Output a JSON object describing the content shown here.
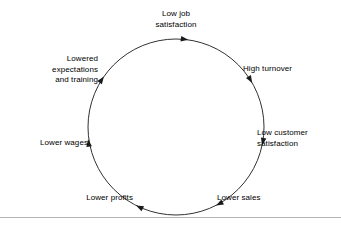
{
  "diagram": {
    "type": "cycle",
    "title": "",
    "direction": "clockwise",
    "background_color": "#ffffff",
    "stroke_color": "#1a1a1a",
    "text_color": "#000000",
    "rule_color": "#b4b4b4",
    "circle": {
      "cx": 176,
      "cy": 127,
      "r": 88
    },
    "nodes": [
      {
        "id": "low-job-satisfaction",
        "label": "Low job\nsatisfaction",
        "position": "top",
        "angle_deg": -90,
        "align": "center"
      },
      {
        "id": "high-turnover",
        "label": "High turnover",
        "position": "upper-right",
        "angle_deg": -30,
        "align": "left"
      },
      {
        "id": "low-customer-satisfaction",
        "label": "Low customer\nsatisfaction",
        "position": "right",
        "angle_deg": 15,
        "align": "left"
      },
      {
        "id": "lower-sales",
        "label": "Lower sales",
        "position": "lower-right",
        "angle_deg": 62,
        "align": "left"
      },
      {
        "id": "lower-profits",
        "label": "Lower profits",
        "position": "lower-left",
        "angle_deg": 118,
        "align": "right"
      },
      {
        "id": "lower-wages",
        "label": "Lower wages",
        "position": "left",
        "angle_deg": 168,
        "align": "right"
      },
      {
        "id": "lowered-expectations-and-training",
        "label": "Lowered\nexpectations\nand training",
        "position": "upper-left",
        "angle_deg": -150,
        "align": "right"
      }
    ],
    "arrowheads": [
      {
        "at_node": "low-job-satisfaction",
        "angle_deg": -82
      },
      {
        "at_node": "high-turnover",
        "angle_deg": -30
      },
      {
        "at_node": "low-customer-satisfaction",
        "angle_deg": 12
      },
      {
        "at_node": "lower-sales",
        "angle_deg": 63
      },
      {
        "at_node": "lower-profits",
        "angle_deg": 117
      },
      {
        "at_node": "lower-wages",
        "angle_deg": 172
      },
      {
        "at_node": "lowered-expectations-and-training",
        "angle_deg": -145
      }
    ],
    "baseline_rule": true
  }
}
